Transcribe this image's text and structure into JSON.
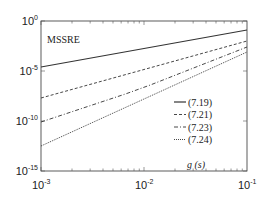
{
  "chart_data": {
    "type": "line",
    "title": "",
    "annotation": "MSSRE",
    "xlabel": "g (s)",
    "ylabel": "",
    "xscale": "log",
    "yscale": "log",
    "xlim": [
      0.001,
      0.1
    ],
    "ylim": [
      1e-15,
      1
    ],
    "grid": false,
    "legend_position": "lower right (inside)",
    "x_ticks": [
      {
        "base": "10",
        "exp": "-3",
        "value": 0.001
      },
      {
        "base": "10",
        "exp": "-2",
        "value": 0.01
      },
      {
        "base": "10",
        "exp": "-1",
        "value": 0.1
      }
    ],
    "y_ticks": [
      {
        "base": "10",
        "exp": "0",
        "value": 1
      },
      {
        "base": "10",
        "exp": "-5",
        "value": 1e-05
      },
      {
        "base": "10",
        "exp": "-10",
        "value": 1e-10
      },
      {
        "base": "10",
        "exp": "-15",
        "value": 1e-15
      }
    ],
    "series": [
      {
        "name": "(7.19)",
        "style": "solid",
        "x": [
          0.001,
          0.01,
          0.1
        ],
        "y": [
          2.5e-05,
          0.01,
          0.13
        ],
        "log10_y": [
          -4.6,
          -2.75,
          -0.9
        ]
      },
      {
        "name": "(7.21)",
        "style": "dashed",
        "x": [
          0.001,
          0.01,
          0.1
        ],
        "y": [
          2e-08,
          1e-05,
          0.01
        ],
        "log10_y": [
          -7.7,
          -4.85,
          -2.0
        ]
      },
      {
        "name": "(7.23)",
        "style": "dashdot",
        "x": [
          0.001,
          0.0066,
          0.0115,
          0.1
        ],
        "y": [
          8e-11,
          5e-08,
          4e-07,
          0.0025
        ],
        "log10_y": [
          -10.1,
          -7.3,
          -6.4,
          -2.6
        ]
      },
      {
        "name": "(7.24)",
        "style": "dotted",
        "x": [
          0.001,
          0.01,
          0.1
        ],
        "y": [
          3e-13,
          6e-09,
          0.0008
        ],
        "log10_y": [
          -12.5,
          -7.8,
          -3.1
        ]
      }
    ]
  }
}
